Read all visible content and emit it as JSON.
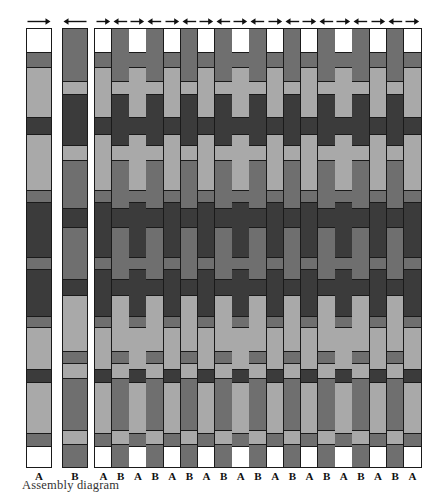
{
  "caption": "Assembly diagram",
  "colors": {
    "dark": "#3b3b3b",
    "medium": "#6f6f6f",
    "light": "#a9a9a9",
    "white": "#ffffff",
    "outline": "#1a1a1a",
    "text": "#111111",
    "caption_text": "#333333",
    "background": "#ffffff"
  },
  "legend": {
    "strip_a_label": "A",
    "strip_b_label": "B"
  },
  "strips": {
    "a": {
      "label": "A",
      "x": 26,
      "y": 28,
      "width": 26,
      "height": 440,
      "segments": [
        {
          "color": "white",
          "length": 26
        },
        {
          "color": "medium",
          "length": 17
        },
        {
          "color": "light",
          "length": 55
        },
        {
          "color": "dark",
          "length": 20
        },
        {
          "color": "light",
          "length": 62
        },
        {
          "color": "medium",
          "length": 13
        },
        {
          "color": "dark",
          "length": 62
        },
        {
          "color": "medium",
          "length": 14
        },
        {
          "color": "dark",
          "length": 52
        },
        {
          "color": "medium",
          "length": 12
        },
        {
          "color": "light",
          "length": 47
        },
        {
          "color": "dark",
          "length": 15
        },
        {
          "color": "light",
          "length": 57
        },
        {
          "color": "medium",
          "length": 14
        },
        {
          "color": "white",
          "length": 24
        }
      ]
    },
    "b": {
      "label": "B",
      "x": 62,
      "y": 28,
      "width": 26,
      "height": 440,
      "segments": [
        {
          "color": "medium",
          "length": 52
        },
        {
          "color": "light",
          "length": 13
        },
        {
          "color": "dark",
          "length": 52
        },
        {
          "color": "light",
          "length": 15
        },
        {
          "color": "medium",
          "length": 48
        },
        {
          "color": "dark",
          "length": 19
        },
        {
          "color": "medium",
          "length": 52
        },
        {
          "color": "dark",
          "length": 16
        },
        {
          "color": "light",
          "length": 56
        },
        {
          "color": "medium",
          "length": 13
        },
        {
          "color": "light",
          "length": 15
        },
        {
          "color": "medium",
          "length": 52
        },
        {
          "color": "light",
          "length": 14
        },
        {
          "color": "medium",
          "length": 23
        }
      ]
    }
  },
  "grid": {
    "x": 94,
    "y": 28,
    "width": 328,
    "height": 440,
    "column_count": 19,
    "column_width": 16.2,
    "column_labels": [
      "A",
      "B",
      "A",
      "B",
      "A",
      "B",
      "A",
      "B",
      "A",
      "B",
      "A",
      "B",
      "A",
      "B",
      "A",
      "B",
      "A",
      "B",
      "A"
    ],
    "arrow_directions": [
      "right",
      "left",
      "right",
      "left",
      "right",
      "left",
      "right",
      "left",
      "right",
      "left",
      "right",
      "left",
      "right",
      "left",
      "right",
      "left",
      "right",
      "left",
      "right"
    ],
    "column_a_segments": [
      {
        "color": "white",
        "length": 26
      },
      {
        "color": "medium",
        "length": 17
      },
      {
        "color": "light",
        "length": 55
      },
      {
        "color": "dark",
        "length": 20
      },
      {
        "color": "light",
        "length": 62
      },
      {
        "color": "medium",
        "length": 13
      },
      {
        "color": "dark",
        "length": 62
      },
      {
        "color": "medium",
        "length": 14
      },
      {
        "color": "dark",
        "length": 52
      },
      {
        "color": "medium",
        "length": 12
      },
      {
        "color": "light",
        "length": 47
      },
      {
        "color": "dark",
        "length": 15
      },
      {
        "color": "light",
        "length": 57
      },
      {
        "color": "medium",
        "length": 14
      },
      {
        "color": "white",
        "length": 24
      }
    ],
    "column_b_segments": [
      {
        "color": "medium",
        "length": 52
      },
      {
        "color": "light",
        "length": 13
      },
      {
        "color": "dark",
        "length": 52
      },
      {
        "color": "light",
        "length": 15
      },
      {
        "color": "medium",
        "length": 48
      },
      {
        "color": "dark",
        "length": 19
      },
      {
        "color": "medium",
        "length": 52
      },
      {
        "color": "dark",
        "length": 16
      },
      {
        "color": "light",
        "length": 56
      },
      {
        "color": "medium",
        "length": 13
      },
      {
        "color": "light",
        "length": 15
      },
      {
        "color": "medium",
        "length": 52
      },
      {
        "color": "light",
        "length": 14
      },
      {
        "color": "medium",
        "length": 23
      }
    ]
  },
  "top_arrows": {
    "reference": [
      {
        "direction": "right",
        "x": 26,
        "width": 26
      },
      {
        "direction": "left",
        "x": 62,
        "width": 26
      }
    ],
    "y": 16
  }
}
